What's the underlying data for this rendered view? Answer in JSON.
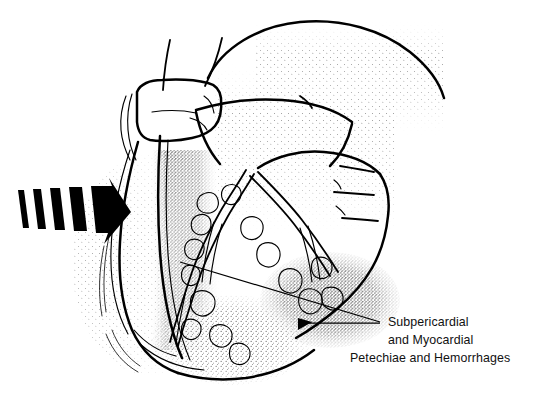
{
  "figure": {
    "background_color": "#ffffff",
    "ink_color": "#000000",
    "width": 533,
    "height": 405
  },
  "annotation": {
    "label_lines": [
      "Subpericardial",
      "and Myocardial",
      "Petechiae and Hemorrhages"
    ],
    "line1": "Subpericardial",
    "line2": "and Myocardial",
    "line3": "Petechiae and Hemorrhages",
    "text_align": "center",
    "text_color": "#111111",
    "leader_count": 2,
    "leader_converge_x": 380,
    "leader_converge_y": 322
  },
  "pointer": {
    "name": "hatched-block-arrow",
    "direction": "right",
    "bar_count": 5,
    "fill_color": "#000000",
    "points_at": "left ventricular free wall"
  },
  "anatomy": {
    "structures": [
      "aorta",
      "pulmonary-artery",
      "left-atrial-appendage",
      "left-ventricle",
      "right-ventricle",
      "right-atrium",
      "coronary-arteries",
      "epicardial-fat"
    ],
    "stipple_regions": [
      "left-ventricle-shading",
      "petechial-hemorrhage-field",
      "right-ventricle-shading"
    ]
  }
}
